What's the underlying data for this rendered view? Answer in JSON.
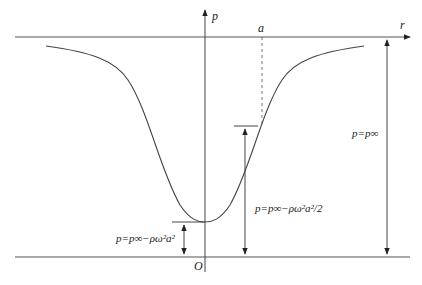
{
  "diagram": {
    "axes": {
      "y_label": "p",
      "x_label": "r",
      "origin_label": "O",
      "radius_marker": "a"
    },
    "annotations": {
      "far_field": "p=p∞",
      "at_radius_a": "p=p∞−ρω²a²/2",
      "at_center": "p=p∞−ρω²a²"
    },
    "colors": {
      "line": "#333333",
      "background": "#ffffff"
    }
  }
}
